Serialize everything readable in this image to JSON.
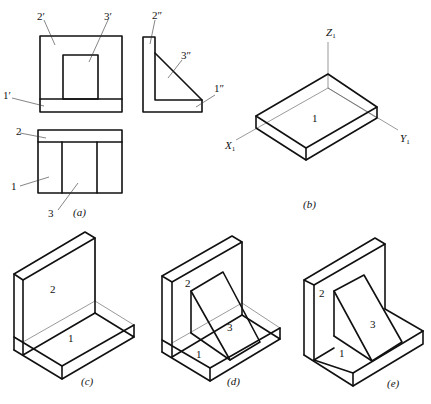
{
  "figure": {
    "panel_a": {
      "caption": "(a)",
      "front_view_labels": {
        "part2": "2′",
        "part3": "3′",
        "part1": "1′"
      },
      "side_view_labels": {
        "part2": "2″",
        "part3": "3″",
        "part1": "1″"
      },
      "top_view_labels": {
        "part2": "2",
        "part1": "1",
        "part3": "3"
      }
    },
    "panel_b": {
      "caption": "(b)",
      "axis_z": "Z",
      "axis_x": "X",
      "axis_y": "Y",
      "axis_subscript": "1",
      "part_label": "1"
    },
    "panel_c": {
      "caption": "(c)",
      "labels": {
        "part2": "2",
        "part1": "1"
      }
    },
    "panel_d": {
      "caption": "(d)",
      "labels": {
        "part2": "2",
        "part3": "3",
        "part1": "1"
      }
    },
    "panel_e": {
      "caption": "(e)",
      "labels": {
        "part2": "2",
        "part3": "3",
        "part1": "1"
      }
    },
    "colors": {
      "line": "#111111",
      "hidden_line": "#555555",
      "background": "#ffffff"
    }
  }
}
